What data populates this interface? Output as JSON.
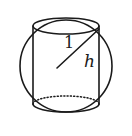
{
  "figure": {
    "background_color": "#ffffff",
    "stroke_color": "#1a1a1a",
    "labels": {
      "radius_label": "1",
      "height_label": "h"
    },
    "geometry": {
      "circle": {
        "center_x": 66,
        "center_y": 66,
        "radius": 46
      },
      "cylinder": {
        "left_x": 33,
        "right_x": 99,
        "top_y": 26,
        "bottom_y": 104,
        "ellipse_rx": 33,
        "ellipse_ry": 8
      },
      "diagonal": {
        "x1": 99,
        "y1": 29,
        "x2": 57,
        "y2": 68
      }
    }
  }
}
